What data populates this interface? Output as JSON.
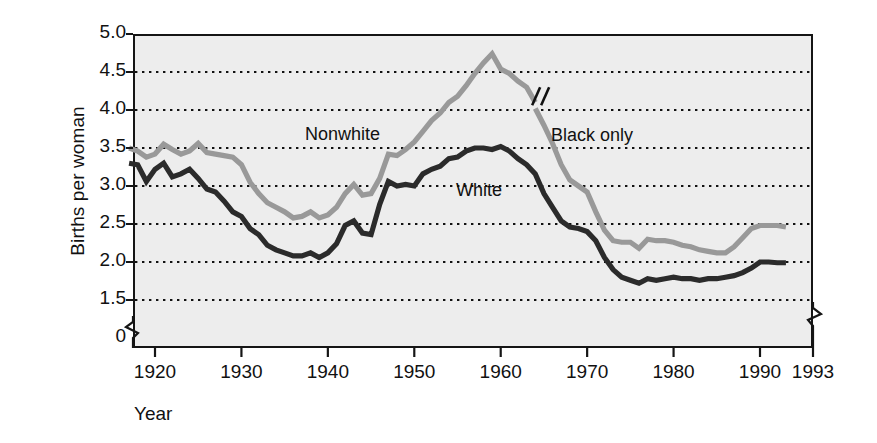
{
  "chart_data": {
    "type": "line",
    "title": "",
    "xlabel": "Year",
    "ylabel": "Births per woman",
    "xlim": [
      1917,
      1993
    ],
    "ylim": [
      1.25,
      5.0
    ],
    "grid": true,
    "grid_style": "dotted-horizontal",
    "legend_position": "inline-annotations",
    "axis_break_y": true,
    "axis_break_x": true,
    "y_ticks": [
      "5.0",
      "4.5",
      "4.0",
      "3.5",
      "3.0",
      "2.5",
      "2.0",
      "1.5",
      "0"
    ],
    "y_tick_values": [
      5.0,
      4.5,
      4.0,
      3.5,
      3.0,
      2.5,
      2.0,
      1.5,
      0
    ],
    "x_ticks": [
      "1920",
      "1930",
      "1940",
      "1950",
      "1960",
      "1970",
      "1980",
      "1990",
      "1993"
    ],
    "x_tick_values": [
      1920,
      1930,
      1940,
      1950,
      1960,
      1970,
      1980,
      1990,
      1993
    ],
    "annotations": [
      {
        "text": "Nonwhite",
        "x": 1940,
        "y": 3.85,
        "color": "#8c8c8c"
      },
      {
        "text": "White",
        "x": 1955,
        "y": 3.1,
        "color": "#333333"
      },
      {
        "text": "Black only",
        "x": 1966,
        "y": 3.78,
        "color": "#8c8c8c"
      }
    ],
    "series": [
      {
        "name": "Nonwhite",
        "color": "#999999",
        "note": "series discontinued after 1964 (axis break mark)",
        "x": [
          1917,
          1918,
          1919,
          1920,
          1921,
          1922,
          1923,
          1924,
          1925,
          1926,
          1927,
          1928,
          1929,
          1930,
          1931,
          1932,
          1933,
          1934,
          1935,
          1936,
          1937,
          1938,
          1939,
          1940,
          1941,
          1942,
          1943,
          1944,
          1945,
          1946,
          1947,
          1948,
          1949,
          1950,
          1951,
          1952,
          1953,
          1954,
          1955,
          1956,
          1957,
          1958,
          1959,
          1960,
          1961,
          1962,
          1963,
          1964
        ],
        "values": [
          3.5,
          3.46,
          3.38,
          3.42,
          3.55,
          3.48,
          3.42,
          3.46,
          3.56,
          3.44,
          3.42,
          3.4,
          3.38,
          3.28,
          3.05,
          2.9,
          2.78,
          2.72,
          2.66,
          2.58,
          2.6,
          2.66,
          2.58,
          2.62,
          2.72,
          2.9,
          3.02,
          2.88,
          2.9,
          3.1,
          3.42,
          3.4,
          3.48,
          3.58,
          3.72,
          3.86,
          3.96,
          4.1,
          4.18,
          4.32,
          4.48,
          4.62,
          4.74,
          4.54,
          4.48,
          4.38,
          4.3,
          4.1
        ]
      },
      {
        "name": "Black only",
        "color": "#999999",
        "note": "series begins 1964 after axis break",
        "x": [
          1964,
          1965,
          1966,
          1967,
          1968,
          1969,
          1970,
          1971,
          1972,
          1973,
          1974,
          1975,
          1976,
          1977,
          1978,
          1979,
          1980,
          1981,
          1982,
          1983,
          1984,
          1985,
          1986,
          1987,
          1988,
          1989,
          1990,
          1991,
          1992,
          1993
        ],
        "values": [
          4.02,
          3.8,
          3.56,
          3.28,
          3.08,
          3.0,
          2.92,
          2.66,
          2.42,
          2.28,
          2.26,
          2.26,
          2.18,
          2.3,
          2.28,
          2.28,
          2.26,
          2.22,
          2.2,
          2.16,
          2.14,
          2.12,
          2.12,
          2.2,
          2.32,
          2.44,
          2.48,
          2.48,
          2.48,
          2.46
        ]
      },
      {
        "name": "White",
        "color": "#2b2b2b",
        "x": [
          1917,
          1918,
          1919,
          1920,
          1921,
          1922,
          1923,
          1924,
          1925,
          1926,
          1927,
          1928,
          1929,
          1930,
          1931,
          1932,
          1933,
          1934,
          1935,
          1936,
          1937,
          1938,
          1939,
          1940,
          1941,
          1942,
          1943,
          1944,
          1945,
          1946,
          1947,
          1948,
          1949,
          1950,
          1951,
          1952,
          1953,
          1954,
          1955,
          1956,
          1957,
          1958,
          1959,
          1960,
          1961,
          1962,
          1963,
          1964,
          1965,
          1966,
          1967,
          1968,
          1969,
          1970,
          1971,
          1972,
          1973,
          1974,
          1975,
          1976,
          1977,
          1978,
          1979,
          1980,
          1981,
          1982,
          1983,
          1984,
          1985,
          1986,
          1987,
          1988,
          1989,
          1990,
          1991,
          1992,
          1993
        ],
        "values": [
          3.3,
          3.28,
          3.06,
          3.22,
          3.3,
          3.12,
          3.16,
          3.22,
          3.1,
          2.96,
          2.92,
          2.8,
          2.66,
          2.6,
          2.44,
          2.36,
          2.22,
          2.16,
          2.12,
          2.08,
          2.08,
          2.12,
          2.06,
          2.12,
          2.24,
          2.48,
          2.54,
          2.38,
          2.36,
          2.76,
          3.06,
          3.0,
          3.02,
          3.0,
          3.16,
          3.22,
          3.26,
          3.36,
          3.38,
          3.46,
          3.5,
          3.5,
          3.48,
          3.52,
          3.46,
          3.36,
          3.28,
          3.16,
          2.9,
          2.72,
          2.54,
          2.46,
          2.44,
          2.4,
          2.28,
          2.06,
          1.9,
          1.8,
          1.76,
          1.72,
          1.78,
          1.76,
          1.78,
          1.8,
          1.78,
          1.78,
          1.76,
          1.78,
          1.78,
          1.8,
          1.82,
          1.86,
          1.92,
          2.0,
          2.0,
          1.99,
          1.99
        ]
      }
    ]
  },
  "axis": {
    "y_title": "Births per woman",
    "x_title": "Year"
  },
  "labels": {
    "nonwhite": "Nonwhite",
    "white": "White",
    "black_only": "Black only"
  },
  "style": {
    "plot_background": "#ededed",
    "frame_color": "#151515",
    "gray_series_color": "#999999",
    "dark_series_color": "#2b2b2b",
    "grid_color": "#111111"
  }
}
